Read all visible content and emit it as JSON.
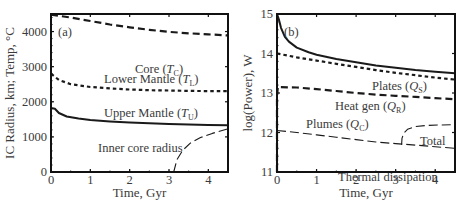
{
  "chart_data": [
    {
      "type": "line",
      "panel_label": "(a)",
      "title": "",
      "xlabel": "Time, Gyr",
      "ylabel": "IC Radius, km; Temp, °C",
      "xlim": [
        0,
        4.5
      ],
      "ylim": [
        0,
        4500
      ],
      "xticks": [
        0,
        1,
        2,
        3,
        4
      ],
      "yticks": [
        0,
        1000,
        2000,
        3000,
        4000
      ],
      "grid": false,
      "series": [
        {
          "name": "Core (T_C)",
          "label": "Core (",
          "sym": "T",
          "sub": "C",
          "style": "dash-long",
          "width": 2.2,
          "x": [
            0,
            0.5,
            1,
            1.5,
            2,
            2.5,
            3,
            3.5,
            4,
            4.5
          ],
          "y": [
            4480,
            4400,
            4300,
            4200,
            4120,
            4050,
            3990,
            3950,
            3920,
            3890
          ],
          "label_pos": [
            135,
            73
          ]
        },
        {
          "name": "Lower Mantle (T_L)",
          "label": "Lower Mantle (",
          "sym": "T",
          "sub": "L",
          "style": "dot-short",
          "width": 2.2,
          "x": [
            0,
            0.2,
            0.5,
            1,
            1.5,
            2,
            2.5,
            3,
            3.5,
            4,
            4.5
          ],
          "y": [
            2800,
            2620,
            2500,
            2420,
            2380,
            2350,
            2330,
            2320,
            2310,
            2305,
            2300
          ],
          "label_pos": [
            104,
            83
          ]
        },
        {
          "name": "Upper Mantle (T_U)",
          "label": "Upper Mantle (",
          "sym": "T",
          "sub": "U",
          "style": "solid",
          "width": 2.0,
          "x": [
            0,
            0.1,
            0.2,
            0.4,
            0.7,
            1,
            1.5,
            2,
            2.5,
            3,
            3.5,
            4,
            4.5
          ],
          "y": [
            1820,
            1800,
            1680,
            1580,
            1520,
            1480,
            1440,
            1410,
            1390,
            1370,
            1355,
            1340,
            1330
          ],
          "label_pos": [
            104,
            117
          ]
        },
        {
          "name": "Inner core radius",
          "label": "Inner core radius",
          "sym": "",
          "sub": "",
          "style": "dash-thin",
          "width": 1.1,
          "x": [
            3.12,
            3.2,
            3.35,
            3.55,
            3.8,
            4.1,
            4.5
          ],
          "y": [
            0,
            350,
            620,
            830,
            980,
            1100,
            1230
          ],
          "label_pos": [
            98,
            152
          ]
        }
      ]
    },
    {
      "type": "line",
      "panel_label": "(b)",
      "title": "",
      "xlabel": "Time, Gyr",
      "ylabel": "log(Power), W",
      "xlim": [
        0,
        4.5
      ],
      "ylim": [
        11,
        15
      ],
      "xticks": [
        0,
        1,
        2,
        3,
        4
      ],
      "yticks": [
        11,
        12,
        13,
        14,
        15
      ],
      "grid": false,
      "series": [
        {
          "name": "Plates (Q_S)",
          "label": "Plates (",
          "sym": "Q",
          "sub": "S",
          "style": "solid",
          "width": 2.0,
          "x": [
            0,
            0.05,
            0.1,
            0.2,
            0.3,
            0.5,
            0.8,
            1,
            1.5,
            2,
            2.5,
            3,
            3.5,
            4,
            4.5
          ],
          "y": [
            15.0,
            14.85,
            14.65,
            14.42,
            14.3,
            14.15,
            14.03,
            13.97,
            13.86,
            13.78,
            13.7,
            13.64,
            13.58,
            13.54,
            13.5
          ],
          "label_pos": [
            372,
            90
          ]
        },
        {
          "name": "Heat gen (Q_R)",
          "label": "Heat gen (",
          "sym": "Q",
          "sub": "R",
          "style": "dot-short",
          "width": 2.2,
          "x": [
            0,
            0.5,
            1,
            1.5,
            2,
            2.5,
            3,
            3.5,
            4,
            4.5
          ],
          "y": [
            14.0,
            13.9,
            13.82,
            13.74,
            13.66,
            13.58,
            13.51,
            13.45,
            13.39,
            13.34
          ],
          "label_pos": [
            335,
            110
          ]
        },
        {
          "name": "Plumes (Q_C)",
          "label": "Plumes (",
          "sym": "Q",
          "sub": "C",
          "style": "dash-long",
          "width": 2.2,
          "x": [
            0,
            0.0,
            0.02,
            0.5,
            1,
            1.5,
            2,
            2.5,
            3,
            3.5,
            4,
            4.5
          ],
          "y": [
            11.0,
            12.9,
            13.15,
            13.14,
            13.1,
            13.05,
            13.0,
            12.96,
            12.93,
            12.9,
            12.87,
            12.84
          ],
          "label_pos": [
            306,
            128
          ]
        },
        {
          "name": "Thermal dissipation",
          "label": "Thermal dissipation",
          "sym": "",
          "sub": "",
          "style": "dash-thin",
          "width": 1.1,
          "x": [
            0,
            0.5,
            1,
            1.5,
            2,
            2.5,
            3,
            3.5,
            4,
            4.5
          ],
          "y": [
            12.05,
            12.0,
            11.94,
            11.88,
            11.82,
            11.76,
            11.72,
            11.68,
            11.64,
            11.6
          ],
          "label_pos": [
            338,
            181
          ]
        },
        {
          "name": "Total",
          "label": "Total",
          "sym": "",
          "sub": "",
          "style": "dash-thin",
          "width": 1.1,
          "x": [
            3.15,
            3.16,
            3.2,
            3.3,
            3.5,
            3.8,
            4.1,
            4.5
          ],
          "y": [
            11.69,
            11.85,
            11.98,
            12.08,
            12.15,
            12.18,
            12.19,
            12.2
          ],
          "label_pos": [
            420,
            145
          ]
        }
      ]
    }
  ],
  "panels": [
    {
      "label": "(a)",
      "xlabel": "Time, Gyr",
      "ylabel": "IC Radius, km; Temp, °C"
    },
    {
      "label": "(b)",
      "xlabel": "Time, Gyr",
      "ylabel": "log(Power), W"
    }
  ],
  "colors": {
    "axis": "#111111",
    "line": "#1a1a1a",
    "text": "#3a3a3a",
    "background": "#ffffff"
  }
}
